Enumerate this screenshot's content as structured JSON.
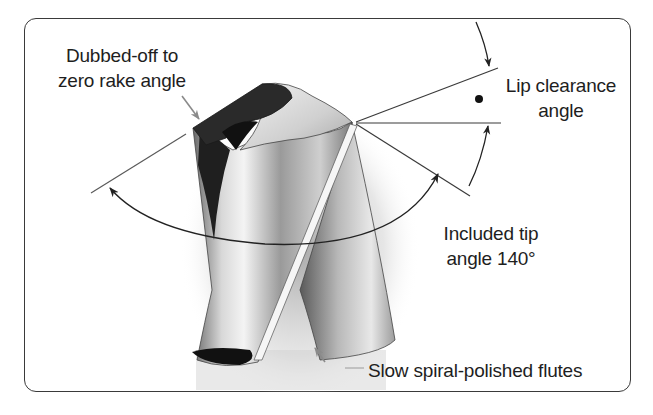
{
  "figure": {
    "labels": {
      "dubbed_line1": "Dubbed-off to",
      "dubbed_line2": "zero rake angle",
      "lip_line1": "Lip clearance",
      "lip_line2": "angle",
      "tip_line1": "Included tip",
      "tip_line2": "angle 140°",
      "flutes": "Slow spiral-polished flutes"
    },
    "values": {
      "included_tip_angle_deg": 140,
      "rake_angle_deg": 0
    },
    "icons": {
      "arrow": "arrow-icon",
      "dot": "bullet-dot-icon"
    },
    "colors": {
      "line": "#3a3a3a",
      "text": "#1e1e1e",
      "pointer": "#8a8a8a",
      "dark_face": "#2a2a2a"
    }
  }
}
